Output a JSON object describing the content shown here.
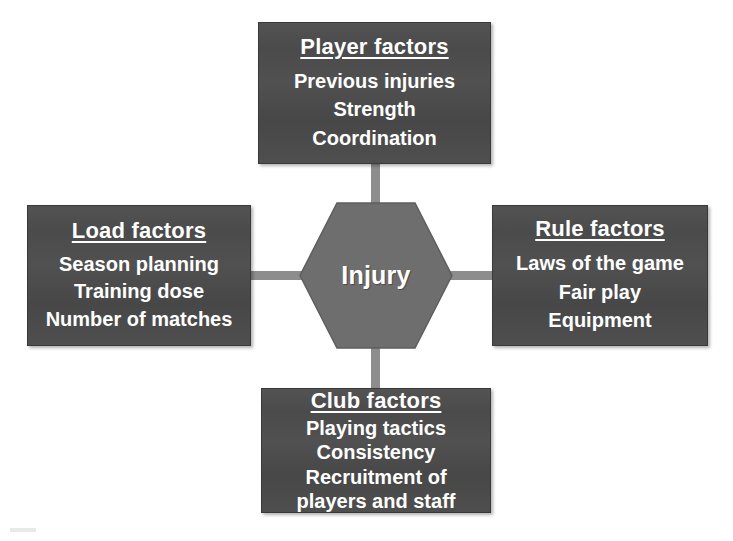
{
  "diagram": {
    "center": {
      "label": "Injury",
      "shape": "hexagon",
      "fill": "#6e6e6e"
    },
    "colors": {
      "box_fill": "#4b4b4b",
      "box_border": "#3a3a3a",
      "hexagon_fill": "#6e6e6e",
      "connector": "#8d8d8d",
      "text": "#ffffff",
      "background": "#ffffff"
    },
    "boxes": [
      {
        "id": "player",
        "position": "top",
        "title": "Player factors",
        "items": [
          "Previous injuries",
          "Strength",
          "Coordination"
        ]
      },
      {
        "id": "load",
        "position": "left",
        "title": "Load factors",
        "items": [
          "Season planning",
          "Training dose",
          "Number of matches"
        ]
      },
      {
        "id": "rule",
        "position": "right",
        "title": "Rule factors",
        "items": [
          "Laws of the game",
          "Fair play",
          "Equipment"
        ]
      },
      {
        "id": "club",
        "position": "bottom",
        "title": "Club factors",
        "items": [
          "Playing tactics",
          "Consistency",
          "Recruitment of",
          "players and staff"
        ]
      }
    ],
    "connectors": [
      {
        "id": "top",
        "orientation": "vertical"
      },
      {
        "id": "bottom",
        "orientation": "vertical"
      },
      {
        "id": "left",
        "orientation": "horizontal"
      },
      {
        "id": "right",
        "orientation": "horizontal"
      }
    ]
  }
}
